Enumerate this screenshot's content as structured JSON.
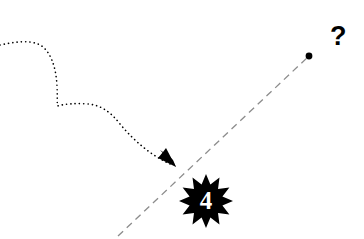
{
  "canvas": {
    "width": 364,
    "height": 239,
    "background_color": "#ffffff"
  },
  "annotations": {
    "question_mark": {
      "text": "?",
      "color": "#000000",
      "x": 330,
      "y": 23
    },
    "burst_badge": {
      "value": "4",
      "fill_color": "#000000",
      "text_color": "#ffffff",
      "center_x": 206,
      "center_y": 201,
      "outer_radius": 27,
      "inner_radius": 17,
      "points": 12
    }
  },
  "paths": {
    "dotted_arrow": {
      "style": "dotted",
      "color": "#000000",
      "stroke_width": 1.6,
      "dash_pattern": "0.1 4.2",
      "has_arrowhead": true,
      "arrowhead_end": "end",
      "start_x": 0,
      "start_y": 45,
      "end_x": 175,
      "end_y": 166
    },
    "dashed_line": {
      "style": "dashed",
      "color": "#8c8c8c",
      "stroke_width": 1.3,
      "dash_pattern": "7 5",
      "start_x": 118,
      "start_y": 236,
      "end_x": 309,
      "end_y": 56,
      "endpoint_dot": {
        "x": 309,
        "y": 56,
        "radius": 3.4,
        "color": "#000000"
      }
    }
  }
}
